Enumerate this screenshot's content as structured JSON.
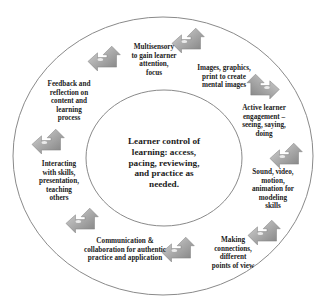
{
  "diagram": {
    "center": {
      "text": "Learner control of\nlearning: access,\npacing, reviewing,\nand practice as\nneeded."
    },
    "items": [
      {
        "id": "multisensory",
        "text": "Multisensory\nto gain learner\nattention,\nfocus"
      },
      {
        "id": "images",
        "text": "Images, graphics,\nprint to create\nmental images"
      },
      {
        "id": "active",
        "text": "Active learner\nengagement –\nseeing, saying,\ndoing"
      },
      {
        "id": "sound",
        "text": "Sound, video,\nmotion,\nanimation for\nmodeling\nskills"
      },
      {
        "id": "connections",
        "text": "Making\nconnections,\ndifferent\npoints of view"
      },
      {
        "id": "communication",
        "text": "Communication &\ncollaboration for authentic\npractice and application"
      },
      {
        "id": "interacting",
        "text": "Interacting\nwith skills,\npresentation,\nteaching\nothers"
      },
      {
        "id": "feedback",
        "text": "Feedback and\nreflection on\ncontent and\nlearning\nprocess"
      }
    ],
    "arrow_icon": "bent-up-left-arrow-icon",
    "colors": {
      "circle_stroke": "#8a8a8a",
      "arrow_fill_light": "#c8c8c8",
      "arrow_fill_dark": "#8c8c8c",
      "text": "#1c1c1c"
    }
  }
}
